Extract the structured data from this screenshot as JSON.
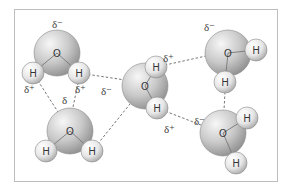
{
  "diagram": {
    "frame": {
      "x": 14,
      "y": 9,
      "w": 263,
      "h": 172,
      "color": "#bdbdbd"
    },
    "colors": {
      "oxygen_light": "#f2f2f2",
      "oxygen_dark": "#9a9a9a",
      "hydrogen_light": "#ffffff",
      "hydrogen_dark": "#b8b8b8",
      "bond": "#777777",
      "hbond": "#666666"
    },
    "labels": {
      "oxygen": "O",
      "hydrogen": "H",
      "delta_minus": "δ⁻",
      "delta_plus": "δ⁺",
      "delta": "δ"
    },
    "molecules": [
      {
        "id": "top-left",
        "O": [
          57,
          53
        ],
        "H": [
          [
            33,
            73
          ],
          [
            79,
            73
          ]
        ]
      },
      {
        "id": "bottom-left",
        "O": [
          70,
          131
        ],
        "H": [
          [
            46,
            151
          ],
          [
            92,
            151
          ]
        ]
      },
      {
        "id": "center",
        "O": [
          145,
          86
        ],
        "H": [
          [
            156,
            67
          ],
          [
            157,
            108
          ]
        ]
      },
      {
        "id": "top-right",
        "O": [
          228,
          53
        ],
        "H": [
          [
            256,
            50
          ],
          [
            225,
            82
          ]
        ]
      },
      {
        "id": "bottom-right",
        "O": [
          223,
          133
        ],
        "H": [
          [
            247,
            118
          ],
          [
            236,
            163
          ]
        ]
      }
    ],
    "charge_labels": [
      {
        "text": "δ⁻",
        "x": 52,
        "y": 28
      },
      {
        "text": "δ⁺",
        "x": 24,
        "y": 93
      },
      {
        "text": "δ⁺",
        "x": 75,
        "y": 93
      },
      {
        "text": "δ",
        "x": 62,
        "y": 104
      },
      {
        "text": "δ⁻",
        "x": 101,
        "y": 95
      },
      {
        "text": "δ⁺",
        "x": 163,
        "y": 62
      },
      {
        "text": "δ⁻",
        "x": 204,
        "y": 31
      },
      {
        "text": "δ⁻",
        "x": 194,
        "y": 125
      },
      {
        "text": "δ⁺",
        "x": 164,
        "y": 133
      }
    ],
    "hydrogen_bonds": [
      [
        [
          79,
          73
        ],
        [
          125,
          80
        ]
      ],
      [
        [
          33,
          73
        ],
        [
          58,
          112
        ]
      ],
      [
        [
          79,
          78
        ],
        [
          72,
          112
        ]
      ],
      [
        [
          92,
          151
        ],
        [
          130,
          104
        ]
      ],
      [
        [
          156,
          67
        ],
        [
          206,
          56
        ]
      ],
      [
        [
          157,
          108
        ],
        [
          201,
          125
        ]
      ],
      [
        [
          225,
          92
        ],
        [
          224,
          110
        ]
      ]
    ]
  }
}
